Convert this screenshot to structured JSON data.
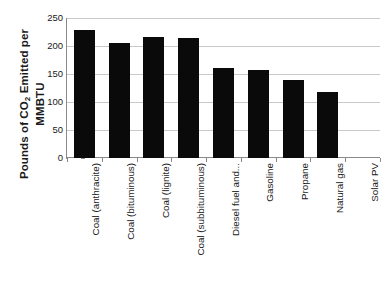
{
  "chart_data": {
    "type": "bar",
    "title": "",
    "xlabel": "",
    "ylabel": "Pounds of CO2 Emitted per MMBTU",
    "ylabel_line1": "Pounds of CO",
    "ylabel_line1_sub": "2",
    "ylabel_line1_rest": " Emitted per",
    "ylabel_line2": "MMBTU",
    "categories": [
      "Coal (anthracite)",
      "Coal (bituminous)",
      "Coal (lignite)",
      "Coal (subbituminous)",
      "Diesel fuel and...",
      "Gasoline",
      "Propane",
      "Natural gas",
      "Solar PV"
    ],
    "values": [
      228.6,
      205.7,
      215.4,
      214.3,
      161.3,
      157.2,
      139.0,
      117.0,
      0
    ],
    "ylim": [
      0,
      250
    ],
    "yticks": [
      0,
      50,
      100,
      150,
      200,
      250
    ],
    "ytick_labels": [
      "0",
      "50",
      "100",
      "150",
      "200",
      "250"
    ],
    "grid": true,
    "legend": false,
    "bar_color": "#0a0a0a",
    "grid_color": "#c9c9c9",
    "axis_color": "#8a8a8a"
  }
}
